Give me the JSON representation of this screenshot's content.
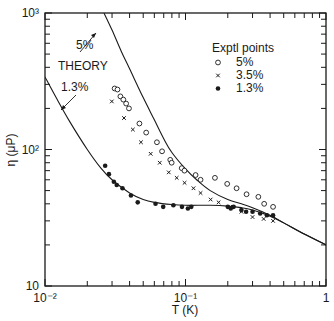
{
  "chart_data": {
    "type": "scatter",
    "title": "",
    "xlabel": "T (K)",
    "ylabel": "η (μP)",
    "xscale": "log",
    "yscale": "log",
    "xlim": [
      0.01,
      1
    ],
    "ylim": [
      10,
      1000
    ],
    "x_tick_labels": [
      "10⁻²",
      "10⁻¹",
      "1"
    ],
    "y_tick_labels": [
      "10",
      "10²",
      "10³"
    ],
    "grid": false,
    "legend": {
      "title": "Exptl points",
      "position": "upper right",
      "entries": [
        {
          "label": "5%",
          "marker": "open-circle"
        },
        {
          "label": "3.5%",
          "marker": "x"
        },
        {
          "label": "1.3%",
          "marker": "filled-circle"
        }
      ]
    },
    "annotations": [
      {
        "text": "THEORY",
        "x": 0.016,
        "y": 250
      },
      {
        "text": "5%",
        "x": 0.021,
        "y": 480,
        "arrow_to": "theory-5"
      },
      {
        "text": "1.3%",
        "x": 0.016,
        "y": 140,
        "arrow_to": "theory-1.3"
      }
    ],
    "series": [
      {
        "name": "Theory 5%",
        "kind": "line",
        "x": [
          0.0263,
          0.03,
          0.035,
          0.04,
          0.05,
          0.06,
          0.07,
          0.08,
          0.1,
          0.12,
          0.15,
          0.2,
          0.25,
          0.3,
          0.4,
          0.5,
          0.7,
          1.0
        ],
        "y": [
          1000,
          750,
          520,
          390,
          240,
          165,
          120,
          95,
          72,
          60,
          50,
          43,
          40,
          37.5,
          33,
          29,
          24,
          20
        ]
      },
      {
        "name": "Theory 1.3%",
        "kind": "line",
        "x": [
          0.01,
          0.012,
          0.015,
          0.02,
          0.025,
          0.03,
          0.04,
          0.05,
          0.06,
          0.08,
          0.1,
          0.15,
          0.2,
          0.25,
          0.3,
          0.4,
          0.5,
          0.7,
          1.0
        ],
        "y": [
          340,
          240,
          160,
          100,
          73,
          60,
          48,
          43,
          41,
          39.5,
          39,
          39,
          38.5,
          37.5,
          36,
          32.5,
          29,
          24,
          20
        ]
      },
      {
        "name": "5%",
        "kind": "scatter",
        "marker": "open-circle",
        "x": [
          0.0313,
          0.0328,
          0.0344,
          0.0361,
          0.0378,
          0.0396,
          0.047,
          0.0525,
          0.0626,
          0.0681,
          0.0779,
          0.0797,
          0.094,
          0.0983,
          0.118,
          0.128,
          0.162,
          0.198,
          0.231,
          0.272,
          0.33,
          0.363,
          0.42
        ],
        "y": [
          280,
          275,
          245,
          232,
          217,
          200,
          155,
          133,
          113,
          97,
          84,
          80,
          73,
          70,
          65,
          60,
          62,
          56,
          52,
          47,
          45,
          40,
          38
        ]
      },
      {
        "name": "3.5%",
        "kind": "scatter",
        "marker": "x",
        "x": [
          0.0299,
          0.0365,
          0.0422,
          0.0482,
          0.0565,
          0.0656,
          0.076,
          0.0866,
          0.0985,
          0.114,
          0.128,
          0.151,
          0.172,
          0.208,
          0.25,
          0.3,
          0.36,
          0.42
        ],
        "y": [
          225,
          170,
          140,
          113,
          93,
          80,
          68,
          62,
          57,
          52,
          48,
          43,
          41,
          38,
          35,
          32,
          31,
          30
        ]
      },
      {
        "name": "1.3%",
        "kind": "scatter",
        "marker": "filled-circle",
        "x": [
          0.0268,
          0.0285,
          0.0309,
          0.0324,
          0.0356,
          0.0409,
          0.0457,
          0.0612,
          0.0694,
          0.082,
          0.0944,
          0.104,
          0.11,
          0.2,
          0.21,
          0.22,
          0.25,
          0.27,
          0.3,
          0.34,
          0.38,
          0.42
        ],
        "y": [
          76,
          66,
          58,
          55,
          52,
          46,
          41,
          40,
          38,
          39,
          38,
          37,
          38,
          38,
          37,
          38,
          36,
          35,
          35,
          34,
          33,
          33
        ]
      }
    ]
  }
}
